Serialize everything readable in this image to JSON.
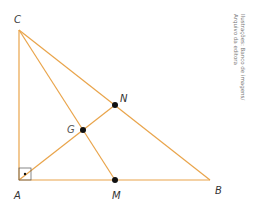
{
  "diagram": {
    "type": "right-triangle-centroid",
    "colors": {
      "line": "#e9a44a",
      "point": "#111111",
      "g_label": "#d94fa8"
    },
    "vertices": {
      "A": {
        "label": "A",
        "x": 19,
        "y": 180
      },
      "B": {
        "label": "B",
        "x": 210,
        "y": 180
      },
      "C": {
        "label": "C",
        "x": 19,
        "y": 30
      }
    },
    "points": {
      "M": {
        "label": "M",
        "x": 115,
        "y": 180
      },
      "N": {
        "label": "N",
        "x": 115,
        "y": 105
      },
      "G": {
        "label": "G",
        "x": 83,
        "y": 130
      }
    },
    "right_angle_at": "A"
  },
  "credit": {
    "line1": "Ilustrações: Banco de imagens/",
    "line2": "Arquivo da editora"
  }
}
